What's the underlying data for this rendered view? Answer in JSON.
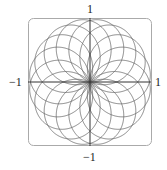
{
  "chart_data": {
    "type": "line",
    "title": "",
    "xlabel": "",
    "ylabel": "",
    "curve": "polar rose r = sin(8θ/7), θ ∈ [0, 14π]",
    "petals": 16,
    "xlim": [
      -1,
      1
    ],
    "ylim": [
      -1,
      1
    ],
    "tick_labels": {
      "top": "1",
      "bottom": "−1",
      "left": "−1",
      "right": "1"
    },
    "grid": false,
    "frame": "rounded-rectangle",
    "colors": {
      "curve": "#6a6a6a",
      "axes": "#333333",
      "frame": "#aaaaaa"
    }
  }
}
